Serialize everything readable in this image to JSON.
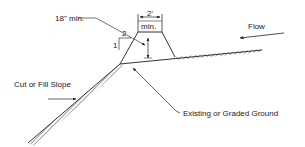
{
  "diagram": {
    "type": "cross-section",
    "labels": {
      "height_min": "18\" min.",
      "top_width_value": "2'",
      "top_width_min": "min.",
      "slope_run": "2",
      "slope_rise": "1",
      "flow": "Flow",
      "cut_fill_slope": "Cut or Fill Slope",
      "existing_ground": "Existing or Graded Ground"
    },
    "colors": {
      "line": "#333333",
      "text": "#222222",
      "background": "#ffffff"
    }
  }
}
